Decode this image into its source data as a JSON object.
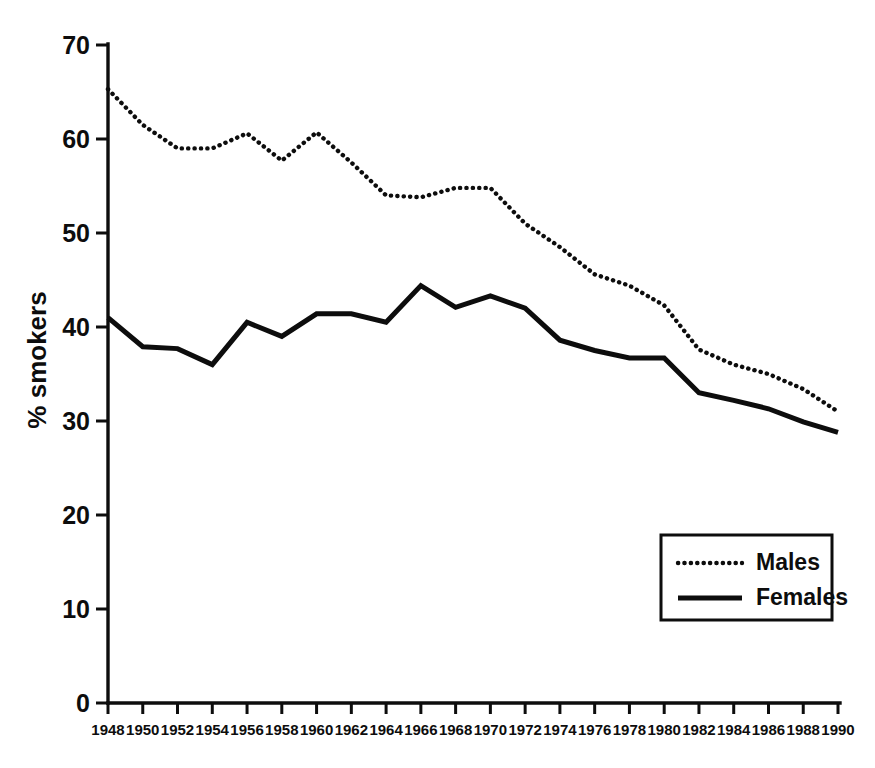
{
  "chart_data": {
    "type": "line",
    "title": "",
    "xlabel": "",
    "ylabel": "% smokers",
    "xlim": [
      1948,
      1990
    ],
    "ylim": [
      0,
      70
    ],
    "grid": false,
    "legend_position": "lower-right",
    "x": [
      1948,
      1950,
      1952,
      1954,
      1956,
      1958,
      1960,
      1962,
      1964,
      1966,
      1968,
      1970,
      1972,
      1974,
      1976,
      1978,
      1980,
      1982,
      1984,
      1986,
      1988,
      1990
    ],
    "xtick_labels": [
      "1948",
      "1950",
      "1952",
      "1954",
      "1956",
      "1958",
      "1960",
      "1962",
      "1964",
      "1966",
      "1968",
      "1970",
      "1972",
      "1974",
      "1976",
      "1978",
      "1980",
      "1982",
      "1984",
      "1986",
      "1988",
      "1990"
    ],
    "ytick_labels": [
      "0",
      "10",
      "20",
      "30",
      "40",
      "50",
      "60",
      "70"
    ],
    "yticks": [
      0,
      10,
      20,
      30,
      40,
      50,
      60,
      70
    ],
    "series": [
      {
        "name": "Males",
        "style": "dotted",
        "color": "#0d0d0d",
        "values": [
          65.3,
          61.5,
          59.0,
          59.0,
          60.6,
          57.7,
          60.7,
          57.5,
          54.0,
          53.8,
          54.8,
          54.8,
          51.0,
          48.5,
          45.6,
          44.4,
          42.3,
          37.6,
          36.0,
          35.0,
          33.4,
          31.0
        ]
      },
      {
        "name": "Females",
        "style": "solid",
        "color": "#0d0d0d",
        "values": [
          41.0,
          37.9,
          37.7,
          36.0,
          40.5,
          39.0,
          41.4,
          41.4,
          40.5,
          44.4,
          42.1,
          43.3,
          42.0,
          38.6,
          37.5,
          36.7,
          36.7,
          33.0,
          32.2,
          31.3,
          29.9,
          28.8
        ]
      }
    ]
  },
  "legend": {
    "entries": [
      {
        "label": "Males",
        "style": "dotted"
      },
      {
        "label": "Females",
        "style": "solid"
      }
    ]
  },
  "axis": {
    "y_title": "% smokers"
  }
}
